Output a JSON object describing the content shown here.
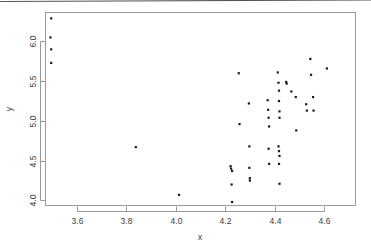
{
  "chart_data": {
    "type": "scatter",
    "title": "",
    "xlabel": "x",
    "ylabel": "y",
    "xlim": [
      3.47,
      4.73
    ],
    "ylim": [
      3.93,
      6.37
    ],
    "grid": false,
    "legend": null,
    "xticks": [
      3.6,
      3.8,
      4.0,
      4.2,
      4.4,
      4.6
    ],
    "xticklabels": [
      "3.6",
      "3.8",
      "4.0",
      "4.2",
      "4.4",
      "4.6"
    ],
    "yticks": [
      4.0,
      4.5,
      5.0,
      5.5,
      6.0
    ],
    "yticklabels": [
      "4.0",
      "4.5",
      "5.0",
      "5.5",
      "6.0"
    ],
    "marker": "point",
    "marker_color": "#1a1a1a",
    "frame_color": "#9a9a9a",
    "background": "#ffffff",
    "n_points": 52,
    "points": [
      {
        "x": 3.495,
        "y": 6.29
      },
      {
        "x": 3.492,
        "y": 6.05
      },
      {
        "x": 3.495,
        "y": 5.9
      },
      {
        "x": 3.495,
        "y": 5.73
      },
      {
        "x": 3.838,
        "y": 4.67
      },
      {
        "x": 4.013,
        "y": 4.07
      },
      {
        "x": 4.222,
        "y": 4.43
      },
      {
        "x": 4.224,
        "y": 4.4
      },
      {
        "x": 4.228,
        "y": 4.37
      },
      {
        "x": 4.226,
        "y": 4.2
      },
      {
        "x": 4.228,
        "y": 3.98
      },
      {
        "x": 4.255,
        "y": 5.6
      },
      {
        "x": 4.258,
        "y": 4.96
      },
      {
        "x": 4.296,
        "y": 5.22
      },
      {
        "x": 4.298,
        "y": 4.68
      },
      {
        "x": 4.298,
        "y": 4.41
      },
      {
        "x": 4.3,
        "y": 4.28
      },
      {
        "x": 4.3,
        "y": 4.25
      },
      {
        "x": 4.372,
        "y": 5.26
      },
      {
        "x": 4.374,
        "y": 5.14
      },
      {
        "x": 4.376,
        "y": 5.04
      },
      {
        "x": 4.378,
        "y": 4.93
      },
      {
        "x": 4.376,
        "y": 4.65
      },
      {
        "x": 4.378,
        "y": 4.46
      },
      {
        "x": 4.413,
        "y": 5.61
      },
      {
        "x": 4.416,
        "y": 5.48
      },
      {
        "x": 4.418,
        "y": 5.38
      },
      {
        "x": 4.418,
        "y": 5.25
      },
      {
        "x": 4.42,
        "y": 5.12
      },
      {
        "x": 4.42,
        "y": 5.04
      },
      {
        "x": 4.416,
        "y": 4.68
      },
      {
        "x": 4.418,
        "y": 4.62
      },
      {
        "x": 4.42,
        "y": 4.56
      },
      {
        "x": 4.418,
        "y": 4.46
      },
      {
        "x": 4.42,
        "y": 4.21
      },
      {
        "x": 4.447,
        "y": 5.49
      },
      {
        "x": 4.449,
        "y": 5.47
      },
      {
        "x": 4.468,
        "y": 5.37
      },
      {
        "x": 4.486,
        "y": 5.3
      },
      {
        "x": 4.488,
        "y": 4.88
      },
      {
        "x": 4.528,
        "y": 5.21
      },
      {
        "x": 4.531,
        "y": 5.13
      },
      {
        "x": 4.545,
        "y": 5.78
      },
      {
        "x": 4.548,
        "y": 5.58
      },
      {
        "x": 4.556,
        "y": 5.3
      },
      {
        "x": 4.558,
        "y": 5.13
      },
      {
        "x": 4.612,
        "y": 5.66
      }
    ]
  },
  "figure": {
    "plot_area": {
      "left": 45,
      "top": 12,
      "right": 356,
      "bottom": 206
    }
  }
}
